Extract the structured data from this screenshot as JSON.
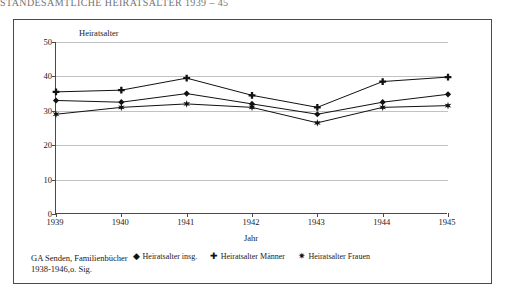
{
  "page": {
    "running_header": "STANDESAMTLICHE HEIRATSALTER 1939 – 45"
  },
  "figure": {
    "y_axis_title": "Heiratsalter",
    "x_axis_title": "Jahr",
    "source_line_1": "GA Senden, Familienbücher",
    "source_line_2": "1938-1946,o. Sig.",
    "legend": [
      {
        "marker": "diamond-marker",
        "glyph": "◆",
        "label": "Heiratsalter insg."
      },
      {
        "marker": "plus-marker",
        "glyph": "✚",
        "label": "Heiratsalter Männer"
      },
      {
        "marker": "star-marker",
        "glyph": "✷",
        "label": "Heiratsalter Frauen"
      }
    ]
  },
  "chart_data": {
    "type": "line",
    "title": "",
    "xlabel": "Jahr",
    "ylabel": "Heiratsalter",
    "categories": [
      "1939",
      "1940",
      "1941",
      "1942",
      "1943",
      "1944",
      "1945"
    ],
    "x": [
      1939,
      1940,
      1941,
      1942,
      1943,
      1944,
      1945
    ],
    "ylim": [
      0,
      50
    ],
    "yticks": [
      0,
      10,
      20,
      30,
      40,
      50
    ],
    "grid": true,
    "legend_position": "bottom",
    "series": [
      {
        "name": "Heiratsalter insg.",
        "marker": "diamond",
        "values": [
          33.0,
          32.5,
          35.0,
          32.0,
          29.0,
          32.5,
          34.8
        ]
      },
      {
        "name": "Heiratsalter Männer",
        "marker": "plus",
        "values": [
          35.5,
          36.0,
          39.5,
          34.5,
          31.0,
          38.5,
          39.8
        ]
      },
      {
        "name": "Heiratsalter Frauen",
        "marker": "star",
        "values": [
          29.0,
          31.0,
          32.0,
          31.0,
          26.5,
          31.0,
          31.5
        ]
      }
    ]
  }
}
